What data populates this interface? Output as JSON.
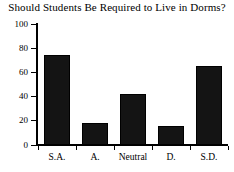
{
  "chart_data": {
    "type": "bar",
    "title": "Should Students Be Required to Live in Dorms?",
    "xlabel": "",
    "ylabel": "",
    "categories": [
      "S.A.",
      "A.",
      "Neutral",
      "D.",
      "S.D."
    ],
    "values": [
      74,
      18,
      42,
      16,
      65
    ],
    "ylim": [
      0,
      100
    ],
    "yticks": [
      0,
      20,
      40,
      60,
      80,
      100
    ],
    "ytick_labels": [
      "0",
      "20",
      "40",
      "60",
      "80",
      "100"
    ],
    "grid": false,
    "legend": false,
    "legend_position": "none",
    "bar_color": "#141414",
    "axis_color": "#000000",
    "background_color": "#ffffff"
  }
}
